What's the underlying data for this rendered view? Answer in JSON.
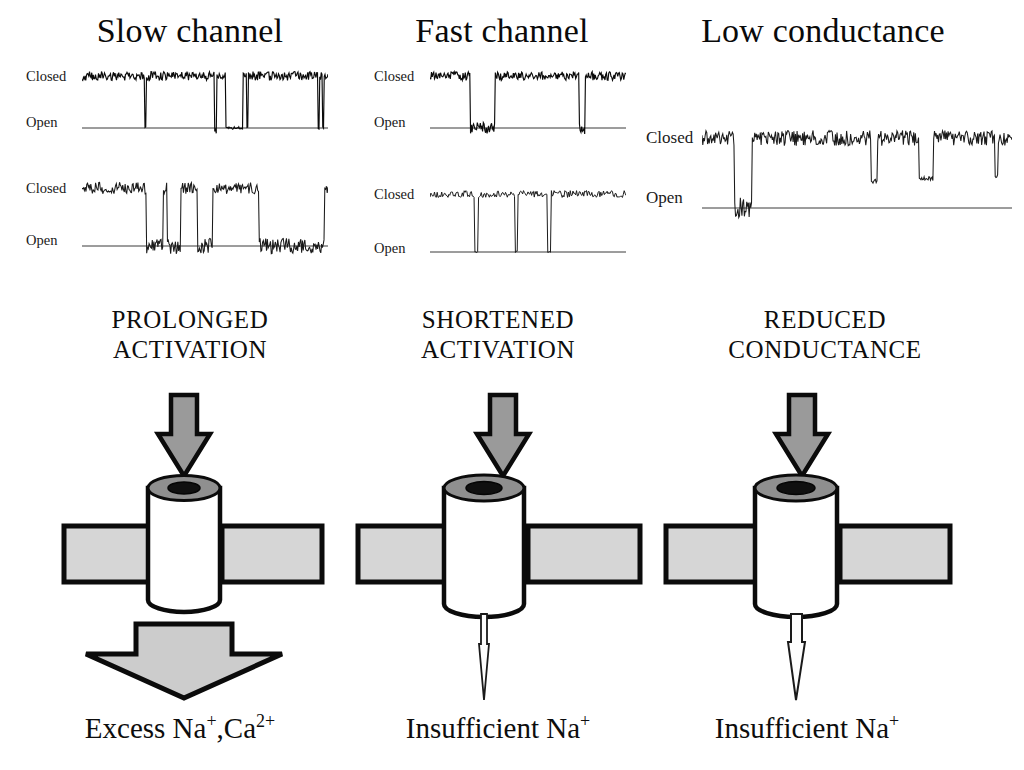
{
  "figure": {
    "background": "#ffffff",
    "ink": "#111111",
    "fill_gray": "#cfcfcf",
    "cap_gray": "#8a8a8a",
    "membrane_gray": "#d4d4d4"
  },
  "columns": [
    {
      "title": "Slow channel",
      "mid_label_line1": "PROLONGED",
      "mid_label_line2": "ACTIVATION",
      "bottom_label": "Excess Na⁺,Ca²⁺",
      "bottom_label_parts": [
        {
          "text": "Excess Na",
          "sup": "+"
        },
        {
          "text": ",Ca",
          "sup": "2+"
        }
      ],
      "efflux_arrow": "large-filled-arrow",
      "traces": [
        {
          "closed_label": "Closed",
          "open_label": "Open"
        },
        {
          "closed_label": "Closed",
          "open_label": "Open"
        }
      ]
    },
    {
      "title": "Fast channel",
      "mid_label_line1": "SHORTENED",
      "mid_label_line2": "ACTIVATION",
      "bottom_label": "Insufficient Na⁺",
      "bottom_label_parts": [
        {
          "text": "Insufficient Na",
          "sup": "+"
        }
      ],
      "efflux_arrow": "thin-needle-arrow",
      "traces": [
        {
          "closed_label": "Closed",
          "open_label": "Open"
        },
        {
          "closed_label": "Closed",
          "open_label": "Open"
        }
      ]
    },
    {
      "title": "Low conductance",
      "mid_label_line1": "REDUCED",
      "mid_label_line2": "CONDUCTANCE",
      "bottom_label": "Insufficient Na⁺",
      "bottom_label_parts": [
        {
          "text": "Insufficient Na",
          "sup": "+"
        }
      ],
      "efflux_arrow": "narrow-needle-arrow",
      "traces": [
        {
          "closed_label": "Closed",
          "open_label": "Open"
        }
      ]
    }
  ],
  "chart_data": {
    "type": "line",
    "ylabel": "",
    "xlabel": "",
    "levels": [
      "Closed",
      "Open"
    ],
    "grid": false,
    "legend": "none",
    "traces": [
      {
        "name": "slow-channel-trace-1",
        "column": "Slow channel",
        "row": 1,
        "baseline_level": "Closed",
        "noise_amplitude": 0.085,
        "openings": [
          {
            "start": 0.255,
            "end": 0.262,
            "depth": 1.0
          },
          {
            "start": 0.537,
            "end": 0.548,
            "depth": 1.0
          },
          {
            "start": 0.585,
            "end": 0.655,
            "depth": 1.0
          },
          {
            "start": 0.668,
            "end": 0.676,
            "depth": 1.0
          },
          {
            "start": 0.958,
            "end": 0.966,
            "depth": 1.0
          },
          {
            "start": 0.976,
            "end": 0.984,
            "depth": 1.0
          }
        ],
        "noisy_open_segments": [
          [
            0.537,
            0.585
          ]
        ]
      },
      {
        "name": "slow-channel-trace-2",
        "column": "Slow channel",
        "row": 2,
        "baseline_level": "Closed",
        "noise_amplitude": 0.1,
        "openings": [
          {
            "start": 0.262,
            "end": 0.33,
            "depth": 1.0
          },
          {
            "start": 0.345,
            "end": 0.4,
            "depth": 1.0
          },
          {
            "start": 0.47,
            "end": 0.53,
            "depth": 1.0
          },
          {
            "start": 0.72,
            "end": 0.985,
            "depth": 1.0
          }
        ],
        "noisy_open_segments": [
          [
            0.262,
            0.4
          ],
          [
            0.47,
            0.53
          ],
          [
            0.72,
            0.985
          ]
        ]
      },
      {
        "name": "fast-channel-trace-1",
        "column": "Fast channel",
        "row": 1,
        "baseline_level": "Closed",
        "noise_amplitude": 0.085,
        "openings": [
          {
            "start": 0.205,
            "end": 0.33,
            "depth": 1.0
          },
          {
            "start": 0.76,
            "end": 0.79,
            "depth": 1.0
          }
        ],
        "noisy_open_segments": [
          [
            0.205,
            0.33
          ],
          [
            0.76,
            0.79
          ]
        ]
      },
      {
        "name": "fast-channel-trace-2",
        "column": "Fast channel",
        "row": 2,
        "baseline_level": "Closed",
        "noise_amplitude": 0.06,
        "openings": [
          {
            "start": 0.225,
            "end": 0.245,
            "depth": 1.0
          },
          {
            "start": 0.435,
            "end": 0.448,
            "depth": 1.0
          },
          {
            "start": 0.6,
            "end": 0.615,
            "depth": 1.0
          }
        ],
        "noisy_open_segments": []
      },
      {
        "name": "low-conductance-trace-1",
        "column": "Low conductance",
        "row": 1,
        "baseline_level": "Closed",
        "noise_amplitude": 0.11,
        "openings": [
          {
            "start": 0.105,
            "end": 0.16,
            "depth": 1.0
          },
          {
            "start": 0.545,
            "end": 0.565,
            "depth": 0.62
          },
          {
            "start": 0.7,
            "end": 0.745,
            "depth": 0.58
          },
          {
            "start": 0.945,
            "end": 0.955,
            "depth": 0.55
          }
        ],
        "noisy_open_segments": [
          [
            0.105,
            0.16
          ]
        ]
      }
    ]
  }
}
